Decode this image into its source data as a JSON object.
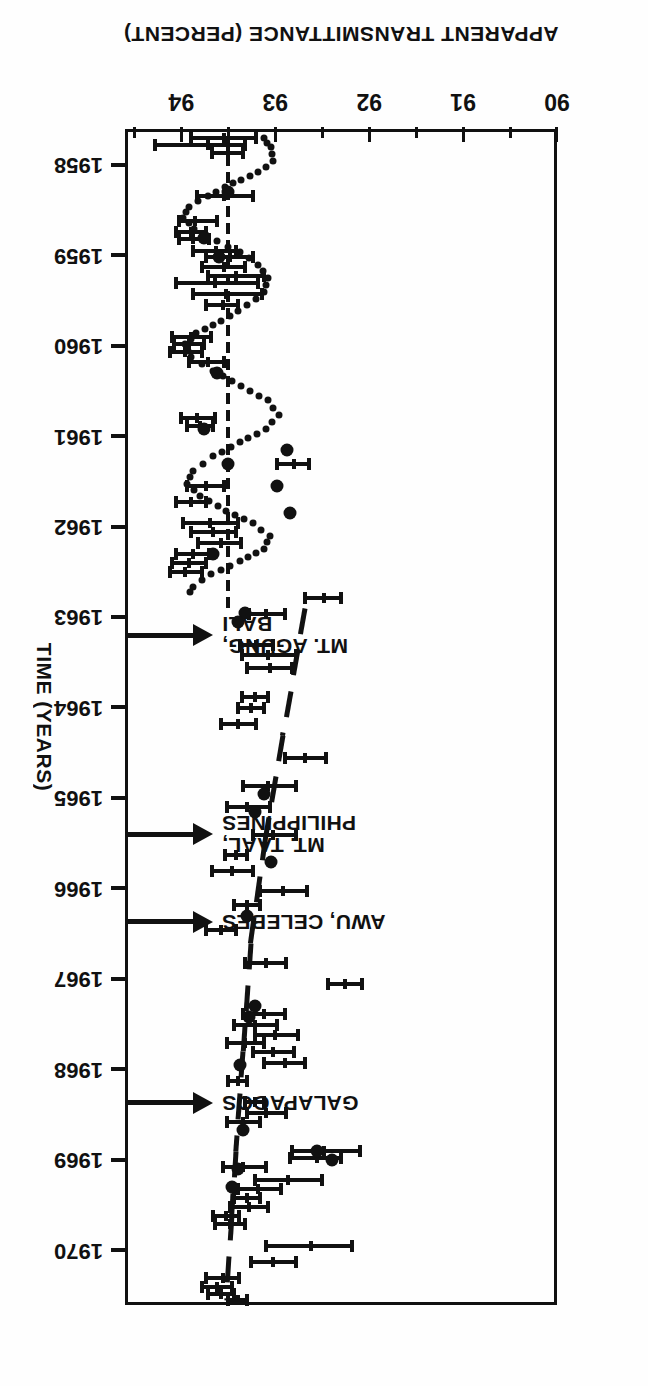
{
  "figure": {
    "orientation_note": "printed upside-down",
    "x_axis": {
      "title": "APPARENT TRANSMITTANCE (PERCENT)",
      "ticks": [
        90,
        91,
        92,
        93,
        94
      ],
      "tick_labels": [
        "90",
        "91",
        "92",
        "93",
        "94"
      ],
      "range": [
        90,
        94.6
      ]
    },
    "y_axis": {
      "title": "TIME (YEARS)",
      "ticks": [
        1958,
        1959,
        1960,
        1961,
        1962,
        1963,
        1964,
        1965,
        1966,
        1967,
        1968,
        1969,
        1970
      ],
      "tick_labels": [
        "1958",
        "1959",
        "1960",
        "1961",
        "1962",
        "1963",
        "1964",
        "1965",
        "1966",
        "1967",
        "1968",
        "1969",
        "1970"
      ],
      "range": [
        1957.6,
        1970.6
      ]
    },
    "annotations": [
      {
        "name": "mt-agung-bali",
        "label_line1": "MT. AGUNG,",
        "label_line2": "BALI",
        "year": 1963.15
      },
      {
        "name": "mt-taal-philippines",
        "label_line1": "MT. TAAL,",
        "label_line2": "PHILIPPINES",
        "year": 1965.35
      },
      {
        "name": "awu-celebes",
        "label_line1": "AWU, CELEBES",
        "label_line2": "",
        "year": 1966.2
      },
      {
        "name": "galapagos",
        "label_line1": "GALAPAGOS",
        "label_line2": "",
        "year": 1968.2
      }
    ]
  },
  "chart_data": {
    "type": "scatter",
    "title": "",
    "xlabel": "APPARENT TRANSMITTANCE (PERCENT)",
    "ylabel": "TIME (YEARS)",
    "xlim": [
      90,
      94.6
    ],
    "ylim": [
      1957.6,
      1970.6
    ],
    "grid": false,
    "legend": "none",
    "series": [
      {
        "name": "apparent transmittance with error bars",
        "type": "errorbar",
        "note": "value = apparent transmittance (percent); time = decimal year; lo/hi = bar extent",
        "points": [
          {
            "time": 1957.7,
            "value": 93.55,
            "lo": 93.18,
            "hi": 93.92
          },
          {
            "time": 1957.78,
            "value": 93.72,
            "lo": 93.3,
            "hi": 94.3
          },
          {
            "time": 1957.86,
            "value": 93.5,
            "lo": 93.32,
            "hi": 93.7
          },
          {
            "time": 1958.34,
            "value": 93.55,
            "lo": 93.22,
            "hi": 93.85
          },
          {
            "time": 1958.62,
            "value": 93.86,
            "lo": 93.6,
            "hi": 94.05
          },
          {
            "time": 1958.74,
            "value": 93.9,
            "lo": 93.72,
            "hi": 94.08
          },
          {
            "time": 1958.82,
            "value": 93.88,
            "lo": 93.68,
            "hi": 94.05
          },
          {
            "time": 1958.95,
            "value": 93.63,
            "lo": 93.4,
            "hi": 93.9
          },
          {
            "time": 1959.02,
            "value": 93.48,
            "lo": 93.22,
            "hi": 93.76
          },
          {
            "time": 1959.12,
            "value": 93.55,
            "lo": 93.3,
            "hi": 93.8
          },
          {
            "time": 1959.22,
            "value": 93.42,
            "lo": 93.1,
            "hi": 93.74
          },
          {
            "time": 1959.3,
            "value": 93.64,
            "lo": 93.16,
            "hi": 94.08
          },
          {
            "time": 1959.42,
            "value": 93.52,
            "lo": 93.12,
            "hi": 93.9
          },
          {
            "time": 1959.55,
            "value": 93.56,
            "lo": 93.38,
            "hi": 93.76
          },
          {
            "time": 1959.9,
            "value": 93.9,
            "lo": 93.66,
            "hi": 94.12
          },
          {
            "time": 1959.98,
            "value": 93.92,
            "lo": 93.74,
            "hi": 94.1
          },
          {
            "time": 1960.06,
            "value": 93.96,
            "lo": 93.76,
            "hi": 94.14
          },
          {
            "time": 1960.18,
            "value": 93.72,
            "lo": 93.52,
            "hi": 93.94
          },
          {
            "time": 1960.8,
            "value": 93.83,
            "lo": 93.62,
            "hi": 94.02
          },
          {
            "time": 1960.88,
            "value": 93.8,
            "lo": 93.64,
            "hi": 93.96
          },
          {
            "time": 1961.55,
            "value": 93.74,
            "lo": 93.52,
            "hi": 93.96
          },
          {
            "time": 1961.72,
            "value": 93.9,
            "lo": 93.72,
            "hi": 94.08
          },
          {
            "time": 1961.95,
            "value": 93.7,
            "lo": 93.38,
            "hi": 94.0
          },
          {
            "time": 1962.05,
            "value": 93.66,
            "lo": 93.4,
            "hi": 93.92
          },
          {
            "time": 1962.18,
            "value": 93.58,
            "lo": 93.34,
            "hi": 93.84
          },
          {
            "time": 1962.3,
            "value": 93.88,
            "lo": 93.68,
            "hi": 94.08
          },
          {
            "time": 1962.4,
            "value": 93.92,
            "lo": 93.72,
            "hi": 94.12
          },
          {
            "time": 1962.5,
            "value": 93.96,
            "lo": 93.76,
            "hi": 94.14
          },
          {
            "time": 1961.3,
            "value": 92.8,
            "lo": 92.62,
            "hi": 93.0
          },
          {
            "time": 1962.96,
            "value": 93.1,
            "lo": 92.88,
            "hi": 93.3
          },
          {
            "time": 1962.78,
            "value": 92.48,
            "lo": 92.28,
            "hi": 92.7
          },
          {
            "time": 1963.3,
            "value": 93.2,
            "lo": 93.0,
            "hi": 93.4
          },
          {
            "time": 1963.42,
            "value": 93.08,
            "lo": 92.76,
            "hi": 93.38
          },
          {
            "time": 1963.56,
            "value": 93.06,
            "lo": 92.8,
            "hi": 93.32
          },
          {
            "time": 1963.88,
            "value": 93.22,
            "lo": 93.06,
            "hi": 93.38
          },
          {
            "time": 1964.0,
            "value": 93.26,
            "lo": 93.1,
            "hi": 93.42
          },
          {
            "time": 1964.18,
            "value": 93.4,
            "lo": 93.18,
            "hi": 93.6
          },
          {
            "time": 1964.55,
            "value": 92.68,
            "lo": 92.44,
            "hi": 92.92
          },
          {
            "time": 1964.86,
            "value": 93.08,
            "lo": 92.76,
            "hi": 93.36
          },
          {
            "time": 1965.1,
            "value": 93.3,
            "lo": 93.04,
            "hi": 93.54
          },
          {
            "time": 1965.4,
            "value": 93.02,
            "lo": 92.76,
            "hi": 93.26
          },
          {
            "time": 1965.62,
            "value": 93.42,
            "lo": 93.28,
            "hi": 93.56
          },
          {
            "time": 1965.8,
            "value": 93.46,
            "lo": 93.22,
            "hi": 93.7
          },
          {
            "time": 1966.02,
            "value": 92.92,
            "lo": 92.64,
            "hi": 93.18
          },
          {
            "time": 1966.18,
            "value": 93.3,
            "lo": 93.14,
            "hi": 93.46
          },
          {
            "time": 1966.45,
            "value": 93.58,
            "lo": 93.4,
            "hi": 93.76
          },
          {
            "time": 1966.82,
            "value": 93.1,
            "lo": 92.86,
            "hi": 93.34
          },
          {
            "time": 1967.05,
            "value": 92.26,
            "lo": 92.06,
            "hi": 92.46
          },
          {
            "time": 1967.38,
            "value": 93.12,
            "lo": 92.88,
            "hi": 93.36
          },
          {
            "time": 1967.5,
            "value": 93.22,
            "lo": 92.96,
            "hi": 93.46
          },
          {
            "time": 1967.62,
            "value": 93.0,
            "lo": 92.74,
            "hi": 93.24
          },
          {
            "time": 1967.7,
            "value": 93.32,
            "lo": 93.1,
            "hi": 93.54
          },
          {
            "time": 1967.8,
            "value": 93.02,
            "lo": 92.78,
            "hi": 93.26
          },
          {
            "time": 1967.92,
            "value": 92.9,
            "lo": 92.66,
            "hi": 93.14
          },
          {
            "time": 1968.12,
            "value": 93.4,
            "lo": 93.28,
            "hi": 93.52
          },
          {
            "time": 1968.36,
            "value": 93.22,
            "lo": 93.1,
            "hi": 93.34
          },
          {
            "time": 1968.48,
            "value": 93.1,
            "lo": 92.86,
            "hi": 93.32
          },
          {
            "time": 1968.58,
            "value": 93.34,
            "lo": 93.14,
            "hi": 93.54
          },
          {
            "time": 1968.9,
            "value": 92.48,
            "lo": 92.08,
            "hi": 92.84
          },
          {
            "time": 1968.98,
            "value": 92.56,
            "lo": 92.28,
            "hi": 92.86
          },
          {
            "time": 1969.08,
            "value": 93.34,
            "lo": 93.08,
            "hi": 93.58
          },
          {
            "time": 1969.22,
            "value": 92.86,
            "lo": 92.48,
            "hi": 93.24
          },
          {
            "time": 1969.32,
            "value": 93.18,
            "lo": 92.92,
            "hi": 93.42
          },
          {
            "time": 1969.42,
            "value": 93.3,
            "lo": 93.14,
            "hi": 93.46
          },
          {
            "time": 1969.52,
            "value": 93.28,
            "lo": 93.06,
            "hi": 93.5
          },
          {
            "time": 1969.62,
            "value": 93.52,
            "lo": 93.36,
            "hi": 93.68
          },
          {
            "time": 1969.7,
            "value": 93.48,
            "lo": 93.3,
            "hi": 93.66
          },
          {
            "time": 1969.95,
            "value": 92.62,
            "lo": 92.16,
            "hi": 93.12
          },
          {
            "time": 1970.12,
            "value": 93.02,
            "lo": 92.76,
            "hi": 93.28
          },
          {
            "time": 1970.3,
            "value": 93.56,
            "lo": 93.36,
            "hi": 93.76
          },
          {
            "time": 1970.4,
            "value": 93.62,
            "lo": 93.44,
            "hi": 93.8
          },
          {
            "time": 1970.48,
            "value": 93.58,
            "lo": 93.42,
            "hi": 93.74
          },
          {
            "time": 1970.55,
            "value": 93.4,
            "lo": 93.28,
            "hi": 93.52
          }
        ]
      },
      {
        "name": "individual observations (filled circles)",
        "type": "scatter",
        "points": [
          {
            "time": 1958.3,
            "value": 93.5
          },
          {
            "time": 1958.8,
            "value": 93.76
          },
          {
            "time": 1959.02,
            "value": 93.6
          },
          {
            "time": 1960.3,
            "value": 93.62
          },
          {
            "time": 1960.92,
            "value": 93.76
          },
          {
            "time": 1961.3,
            "value": 93.5
          },
          {
            "time": 1961.15,
            "value": 92.88
          },
          {
            "time": 1961.55,
            "value": 92.98
          },
          {
            "time": 1961.85,
            "value": 92.84
          },
          {
            "time": 1962.3,
            "value": 93.66
          },
          {
            "time": 1962.95,
            "value": 93.32
          },
          {
            "time": 1963.05,
            "value": 93.4
          },
          {
            "time": 1964.95,
            "value": 93.12
          },
          {
            "time": 1965.15,
            "value": 93.22
          },
          {
            "time": 1965.7,
            "value": 93.05
          },
          {
            "time": 1966.3,
            "value": 93.3
          },
          {
            "time": 1967.3,
            "value": 93.22
          },
          {
            "time": 1967.42,
            "value": 93.28
          },
          {
            "time": 1967.95,
            "value": 93.38
          },
          {
            "time": 1968.66,
            "value": 93.34
          },
          {
            "time": 1969.1,
            "value": 93.4
          },
          {
            "time": 1968.9,
            "value": 92.56
          },
          {
            "time": 1969.0,
            "value": 92.4
          },
          {
            "time": 1969.3,
            "value": 93.46
          }
        ]
      },
      {
        "name": "seasonal model (dotted curve, 1958-1963)",
        "type": "line",
        "style": "dotted",
        "points": [
          {
            "time": 1957.7,
            "value": 93.12
          },
          {
            "time": 1957.8,
            "value": 93.05
          },
          {
            "time": 1957.95,
            "value": 93.02
          },
          {
            "time": 1958.08,
            "value": 93.18
          },
          {
            "time": 1958.2,
            "value": 93.45
          },
          {
            "time": 1958.34,
            "value": 93.72
          },
          {
            "time": 1958.46,
            "value": 93.92
          },
          {
            "time": 1958.58,
            "value": 93.98
          },
          {
            "time": 1958.7,
            "value": 93.86
          },
          {
            "time": 1958.84,
            "value": 93.62
          },
          {
            "time": 1958.96,
            "value": 93.38
          },
          {
            "time": 1959.1,
            "value": 93.18
          },
          {
            "time": 1959.25,
            "value": 93.08
          },
          {
            "time": 1959.4,
            "value": 93.12
          },
          {
            "time": 1959.55,
            "value": 93.3
          },
          {
            "time": 1959.72,
            "value": 93.58
          },
          {
            "time": 1959.86,
            "value": 93.84
          },
          {
            "time": 1959.98,
            "value": 93.96
          },
          {
            "time": 1960.12,
            "value": 93.9
          },
          {
            "time": 1960.28,
            "value": 93.66
          },
          {
            "time": 1960.44,
            "value": 93.36
          },
          {
            "time": 1960.6,
            "value": 93.08
          },
          {
            "time": 1960.76,
            "value": 92.96
          },
          {
            "time": 1960.92,
            "value": 93.1
          },
          {
            "time": 1961.06,
            "value": 93.38
          },
          {
            "time": 1961.22,
            "value": 93.66
          },
          {
            "time": 1961.38,
            "value": 93.88
          },
          {
            "time": 1961.52,
            "value": 93.94
          },
          {
            "time": 1961.66,
            "value": 93.8
          },
          {
            "time": 1961.82,
            "value": 93.52
          },
          {
            "time": 1961.96,
            "value": 93.24
          },
          {
            "time": 1962.1,
            "value": 93.06
          },
          {
            "time": 1962.24,
            "value": 93.12
          },
          {
            "time": 1962.38,
            "value": 93.38
          },
          {
            "time": 1962.52,
            "value": 93.68
          },
          {
            "time": 1962.66,
            "value": 93.88
          },
          {
            "time": 1962.78,
            "value": 93.94
          }
        ]
      },
      {
        "name": "trend line (dashed, 1962.9-1970.6)",
        "type": "line",
        "style": "dashed",
        "points": [
          {
            "time": 1962.9,
            "value": 92.68
          },
          {
            "time": 1964.3,
            "value": 92.92
          },
          {
            "time": 1965.4,
            "value": 93.1
          },
          {
            "time": 1966.6,
            "value": 93.26
          },
          {
            "time": 1967.8,
            "value": 93.34
          },
          {
            "time": 1968.9,
            "value": 93.42
          },
          {
            "time": 1969.6,
            "value": 93.46
          },
          {
            "time": 1970.55,
            "value": 93.52
          }
        ]
      },
      {
        "name": "vertical reference line (1958-1963 at 93.5)",
        "type": "vline",
        "value": 93.5,
        "time_from": 1957.7,
        "time_to": 1962.9
      }
    ]
  }
}
